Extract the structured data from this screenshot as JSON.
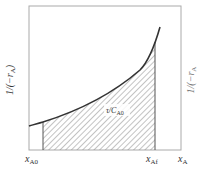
{
  "diagram": {
    "type": "area-under-curve",
    "y_axis_label": {
      "main": "1/(−r",
      "sub": "A",
      "close": ")"
    },
    "x_axis_label": {
      "main": "x",
      "sub": "A"
    },
    "x_ticks": [
      {
        "main": "x",
        "sub": "A0"
      },
      {
        "main": "x",
        "sub": "Af"
      }
    ],
    "area_label": {
      "main": "τ/C",
      "sub": "A0"
    },
    "right_partial_label": {
      "main": "1/(−r",
      "sub": "A"
    },
    "colors": {
      "frame": "#aaaaaa",
      "curve": "#333333",
      "hatch": "#888888",
      "text": "#333333"
    }
  }
}
